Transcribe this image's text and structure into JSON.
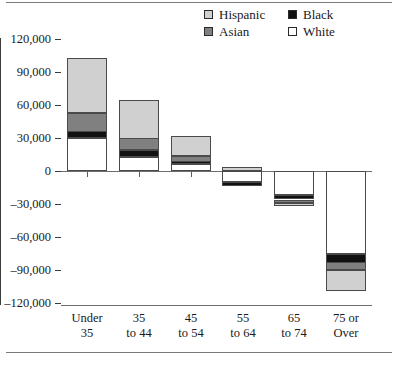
{
  "chart_data": {
    "type": "bar",
    "title": "",
    "xlabel": "",
    "ylabel": "",
    "stacked": true,
    "grid": false,
    "legend_position": "top-right",
    "ylim": [
      -120000,
      120000
    ],
    "yticks": [
      "120,000",
      "90,000",
      "60,000",
      "30,000",
      "0",
      "–30,000",
      "–60,000",
      "–90,000",
      "–120,000"
    ],
    "ytick_values": [
      120000,
      90000,
      60000,
      30000,
      0,
      -30000,
      -60000,
      -90000,
      -120000
    ],
    "categories": [
      "Under 35",
      "35 to 44",
      "45 to 54",
      "55 to 64",
      "65 to 74",
      "75 or Over"
    ],
    "category_lines": [
      {
        "l1": "Under",
        "l2": "35"
      },
      {
        "l1": "35",
        "l2": "to 44"
      },
      {
        "l1": "45",
        "l2": "to 54"
      },
      {
        "l1": "55",
        "l2": "to 64"
      },
      {
        "l1": "65",
        "l2": "to 74"
      },
      {
        "l1": "75 or",
        "l2": "Over"
      }
    ],
    "series": [
      {
        "name": "White",
        "color": "#ffffff",
        "values": [
          30000,
          13000,
          6000,
          -10000,
          -22000,
          -75000
        ]
      },
      {
        "name": "Black",
        "color": "#111111",
        "values": [
          6000,
          6000,
          3000,
          -4000,
          -4000,
          -8000
        ]
      },
      {
        "name": "Asian",
        "color": "#808080",
        "values": [
          17000,
          11000,
          5000,
          0,
          -3000,
          -7000
        ]
      },
      {
        "name": "Hispanic",
        "color": "#d0d0d0",
        "values": [
          50000,
          35000,
          18000,
          4000,
          -3000,
          -19000
        ]
      }
    ],
    "stack_totals": [
      103000,
      65000,
      32000,
      -10000,
      -32000,
      -109000
    ]
  },
  "legend": {
    "items": [
      {
        "label": "Hispanic",
        "swatch": "swatch-hispanic",
        "color": "#d0d0d0"
      },
      {
        "label": "Black",
        "swatch": "swatch-black",
        "color": "#111111"
      },
      {
        "label": "Asian",
        "swatch": "swatch-asian",
        "color": "#808080"
      },
      {
        "label": "White",
        "swatch": "swatch-white",
        "color": "#ffffff"
      }
    ]
  }
}
